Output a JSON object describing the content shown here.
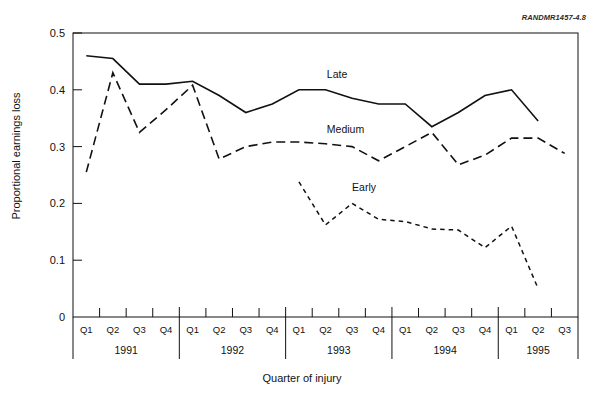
{
  "figure": {
    "id_label": "RANDMR1457-4.8",
    "xlabel": "Quarter of injury",
    "ylabel": "Proportional earnings loss"
  },
  "axes": {
    "y_ticks": [
      "0.5",
      "0.4",
      "0.3",
      "0.2",
      "0.1",
      "0"
    ],
    "y_tick_values": [
      0.5,
      0.4,
      0.3,
      0.2,
      0.1,
      0
    ],
    "quarter_labels": [
      "Q1",
      "Q2",
      "Q3",
      "Q4",
      "Q1",
      "Q2",
      "Q3",
      "Q4",
      "Q1",
      "Q2",
      "Q3",
      "Q4",
      "Q1",
      "Q2",
      "Q3",
      "Q4",
      "Q1",
      "Q2",
      "Q3"
    ],
    "year_labels": [
      "1991",
      "1992",
      "1993",
      "1994",
      "1995"
    ]
  },
  "series_labels": {
    "late": "Late",
    "medium": "Medium",
    "early": "Early"
  },
  "chart_data": {
    "type": "line",
    "title": "",
    "xlabel": "Quarter of injury",
    "ylabel": "Proportional earnings loss",
    "ylim": [
      0,
      0.5
    ],
    "grid": false,
    "legend": "inline-annotation",
    "x": [
      "1991 Q1",
      "1991 Q2",
      "1991 Q3",
      "1991 Q4",
      "1992 Q1",
      "1992 Q2",
      "1992 Q3",
      "1992 Q4",
      "1993 Q1",
      "1993 Q2",
      "1993 Q3",
      "1993 Q4",
      "1994 Q1",
      "1994 Q2",
      "1994 Q3",
      "1994 Q4",
      "1995 Q1",
      "1995 Q2",
      "1995 Q3"
    ],
    "categories": [
      "Q1",
      "Q2",
      "Q3",
      "Q4",
      "Q1",
      "Q2",
      "Q3",
      "Q4",
      "Q1",
      "Q2",
      "Q3",
      "Q4",
      "Q1",
      "Q2",
      "Q3",
      "Q4",
      "Q1",
      "Q2",
      "Q3"
    ],
    "year_groups": [
      {
        "year": "1991",
        "quarters": [
          "Q1",
          "Q2",
          "Q3",
          "Q4"
        ]
      },
      {
        "year": "1992",
        "quarters": [
          "Q1",
          "Q2",
          "Q3",
          "Q4"
        ]
      },
      {
        "year": "1993",
        "quarters": [
          "Q1",
          "Q2",
          "Q3",
          "Q4"
        ]
      },
      {
        "year": "1994",
        "quarters": [
          "Q1",
          "Q2",
          "Q3",
          "Q4"
        ]
      },
      {
        "year": "1995",
        "quarters": [
          "Q1",
          "Q2",
          "Q3"
        ]
      }
    ],
    "series": [
      {
        "name": "Late",
        "style": "solid",
        "values": [
          0.46,
          0.455,
          0.41,
          0.41,
          0.415,
          0.39,
          0.36,
          0.375,
          0.4,
          0.4,
          0.385,
          0.375,
          0.375,
          0.335,
          0.36,
          0.39,
          0.4,
          0.345,
          null
        ]
      },
      {
        "name": "Medium",
        "style": "long-dash",
        "values": [
          0.255,
          0.43,
          0.325,
          0.365,
          0.408,
          0.278,
          0.3,
          0.308,
          0.308,
          0.305,
          0.3,
          0.275,
          0.3,
          0.325,
          0.268,
          0.285,
          0.315,
          0.315,
          0.288
        ]
      },
      {
        "name": "Early",
        "style": "short-dash",
        "values": [
          null,
          null,
          null,
          null,
          null,
          null,
          null,
          null,
          0.238,
          0.162,
          0.2,
          0.172,
          0.168,
          0.155,
          0.153,
          0.122,
          0.16,
          0.05,
          null
        ]
      }
    ]
  }
}
